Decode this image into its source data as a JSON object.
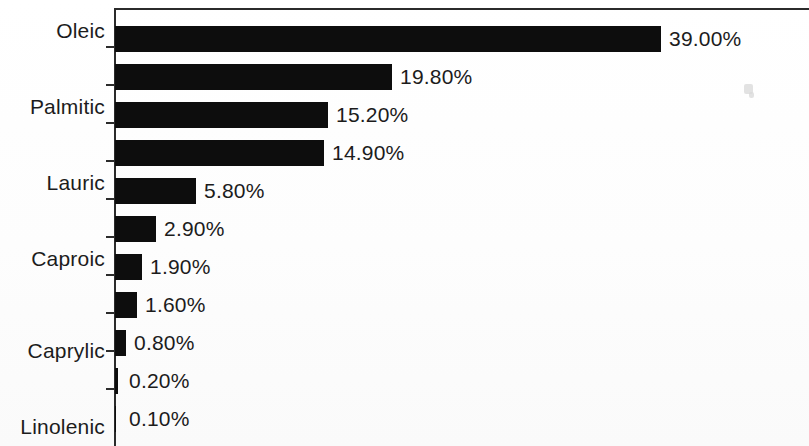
{
  "chart_data": {
    "type": "bar",
    "orientation": "horizontal",
    "title": "",
    "subtitle": "",
    "xlabel": "",
    "ylabel": "",
    "legend": [],
    "legend_position": "none",
    "grid": false,
    "xlim": [
      0,
      39
    ],
    "value_suffix": "%",
    "bar_color": "#0d0d0d",
    "axis_color": "#2b2b2b",
    "background_color": "#ffffff",
    "px_per_unit": 14.0,
    "categories": [
      "Oleic",
      "",
      "Palmitic",
      "",
      "Lauric",
      "",
      "Caproic",
      "",
      "Caprylic",
      "",
      "Linolenic"
    ],
    "values": [
      39.0,
      19.8,
      15.2,
      14.9,
      5.8,
      2.9,
      1.9,
      1.6,
      0.8,
      0.2,
      0.1
    ],
    "value_labels": [
      "39.00%",
      "19.80%",
      "15.20%",
      "14.90%",
      "5.80%",
      "2.90%",
      "1.90%",
      "1.60%",
      "0.80%",
      "0.20%",
      "0.10%"
    ],
    "visible_category_labels": [
      "Oleic",
      "Palmitic",
      "Lauric",
      "Caproic",
      "Caprylic",
      "Linolenic"
    ],
    "rows": [
      {
        "value_label": "39.00%",
        "value": 39.0,
        "category": "Oleic"
      },
      {
        "value_label": "19.80%",
        "value": 19.8,
        "category": ""
      },
      {
        "value_label": "15.20%",
        "value": 15.2,
        "category": "Palmitic"
      },
      {
        "value_label": "14.90%",
        "value": 14.9,
        "category": ""
      },
      {
        "value_label": "5.80%",
        "value": 5.8,
        "category": "Lauric"
      },
      {
        "value_label": "2.90%",
        "value": 2.9,
        "category": ""
      },
      {
        "value_label": "1.90%",
        "value": 1.9,
        "category": "Caproic"
      },
      {
        "value_label": "1.60%",
        "value": 1.6,
        "category": ""
      },
      {
        "value_label": "0.80%",
        "value": 0.8,
        "category": "Caprylic"
      },
      {
        "value_label": "0.20%",
        "value": 0.2,
        "category": ""
      },
      {
        "value_label": "0.10%",
        "value": 0.1,
        "category": "Linolenic"
      }
    ]
  },
  "axis_labels": {
    "oleic": "Oleic",
    "palmitic": "Palmitic",
    "lauric": "Lauric",
    "caproic": "Caproic",
    "caprylic": "Caprylic",
    "linolenic": "Linolenic"
  },
  "bar_labels": {
    "b0": "39.00%",
    "b1": "19.80%",
    "b2": "15.20%",
    "b3": "14.90%",
    "b4": "5.80%",
    "b5": "2.90%",
    "b6": "1.90%",
    "b7": "1.60%",
    "b8": "0.80%",
    "b9": "0.20%",
    "b10": "0.10%"
  }
}
